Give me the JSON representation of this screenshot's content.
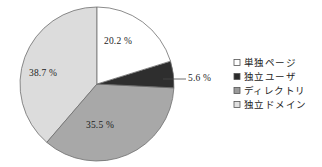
{
  "chart_data": {
    "type": "pie",
    "title": "",
    "subtitle": "",
    "xlabel": "",
    "ylabel": "",
    "grid": false,
    "legend_position": "right",
    "start_angle_deg": 0,
    "direction": "clockwise",
    "units": "percent",
    "categories": [
      "単独ページ",
      "独立ユーザ",
      "ディレクトリ",
      "独立ドメイン"
    ],
    "values": [
      20.2,
      5.6,
      35.5,
      38.7
    ],
    "labels": [
      "20.2 %",
      "5.6 %",
      "35.5 %",
      "38.7 %"
    ],
    "colors": [
      "#ffffff",
      "#2e2e2e",
      "#a8a8a8",
      "#dcdcdc"
    ],
    "slices": [
      {
        "name": "単独ページ",
        "value": 20.2,
        "label": "20.2 %",
        "color": "#ffffff",
        "label_placement": "inside",
        "label_x": 118,
        "label_y": 44
      },
      {
        "name": "独立ユーザ",
        "value": 5.6,
        "label": "5.6 %",
        "color": "#2e2e2e",
        "label_placement": "outside-callout",
        "label_x": 188,
        "label_y": 81
      },
      {
        "name": "ディレクトリ",
        "value": 35.5,
        "label": "35.5 %",
        "color": "#a8a8a8",
        "label_placement": "inside",
        "label_x": 100,
        "label_y": 128
      },
      {
        "name": "独立ドメイン",
        "value": 38.7,
        "label": "38.7 %",
        "color": "#dcdcdc",
        "label_placement": "inside",
        "label_x": 43,
        "label_y": 76
      }
    ]
  },
  "legend": {
    "items": [
      {
        "label": "単独ページ",
        "swatch_color": "#ffffff",
        "marker": "open-square-marker"
      },
      {
        "label": "独立ユーザ",
        "swatch_color": "#2b2b2b",
        "marker": "filled-square-marker"
      },
      {
        "label": "ディレクトリ",
        "swatch_color": "#9a9a9a",
        "marker": "gray-square-marker"
      },
      {
        "label": "独立ドメイン",
        "swatch_color": "#e0e0e0",
        "marker": "light-square-marker"
      }
    ]
  },
  "geometry": {
    "center_x": 97,
    "center_y": 84,
    "radius": 77
  }
}
